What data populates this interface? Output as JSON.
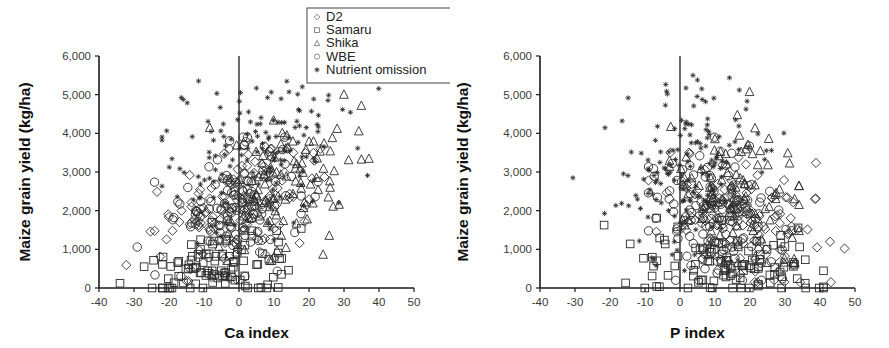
{
  "figure": {
    "panels": [
      "ca",
      "p"
    ]
  },
  "legend": {
    "name": "series-legend",
    "entries": [
      {
        "label": "D2",
        "marker": "diamond",
        "marker_icon": "diamond-marker-icon"
      },
      {
        "label": "Samaru",
        "marker": "square",
        "marker_icon": "square-marker-icon"
      },
      {
        "label": "Shika",
        "marker": "triangle",
        "marker_icon": "triangle-marker-icon"
      },
      {
        "label": "WBE",
        "marker": "circle",
        "marker_icon": "circle-marker-icon"
      },
      {
        "label": "Nutrient omission",
        "marker": "star",
        "marker_icon": "star-marker-icon"
      }
    ]
  },
  "chart_data": [
    {
      "id": "ca",
      "type": "scatter",
      "title": "",
      "xlabel": "Ca index",
      "ylabel": "Maize grain yield (kg/ha)",
      "xlim": [
        -40,
        50
      ],
      "ylim": [
        0,
        6000
      ],
      "xticks": [
        -40,
        -30,
        -20,
        -10,
        0,
        10,
        20,
        30,
        40,
        50
      ],
      "xticklabels": [
        "-40",
        "-30",
        "-20",
        "-10",
        "0",
        "10",
        "20",
        "30",
        "40",
        "50"
      ],
      "yticks": [
        0,
        1000,
        2000,
        3000,
        4000,
        5000,
        6000
      ],
      "yticklabels": [
        "0",
        "1,000",
        "2,000",
        "3,000",
        "4,000",
        "5,000",
        "6,000"
      ],
      "grid": false,
      "zero_reference_line": 0,
      "legend_position": "top-right-outside",
      "series": [
        {
          "name": "D2",
          "marker": "diamond",
          "n": 118,
          "x_center": -2.0,
          "x_spread": 11.5,
          "x_min": -36,
          "x_max": 34,
          "y_center": 1950,
          "y_spread": 780,
          "y_min": 180,
          "y_max": 3600,
          "slope": 38,
          "seed": 1201
        },
        {
          "name": "Samaru",
          "marker": "square",
          "n": 95,
          "x_center": -4.0,
          "x_spread": 11.0,
          "x_min": -34,
          "x_max": 21,
          "y_center": 620,
          "y_spread": 470,
          "y_min": 0,
          "y_max": 1700,
          "slope": 12,
          "seed": 2309
        },
        {
          "name": "Shika",
          "marker": "triangle",
          "n": 102,
          "x_center": 14.0,
          "x_spread": 10.5,
          "x_min": -12,
          "x_max": 40,
          "y_center": 2700,
          "y_spread": 900,
          "y_min": 700,
          "y_max": 5000,
          "slope": 30,
          "seed": 3407
        },
        {
          "name": "WBE",
          "marker": "circle",
          "n": 126,
          "x_center": -1.0,
          "x_spread": 10.0,
          "x_min": -30,
          "x_max": 30,
          "y_center": 2150,
          "y_spread": 800,
          "y_min": 300,
          "y_max": 3900,
          "slope": 34,
          "seed": 4513
        },
        {
          "name": "Nutrient omission",
          "marker": "star",
          "n": 150,
          "x_center": 4.0,
          "x_spread": 13.5,
          "x_min": -22,
          "x_max": 40,
          "y_center": 3500,
          "y_spread": 1050,
          "y_min": 900,
          "y_max": 5600,
          "slope": 18,
          "seed": 5619
        }
      ]
    },
    {
      "id": "p",
      "type": "scatter",
      "title": "",
      "xlabel": "P index",
      "ylabel": "Maize grain yield (kg/ha)",
      "xlim": [
        -40,
        50
      ],
      "ylim": [
        0,
        6000
      ],
      "xticks": [
        -40,
        -30,
        -20,
        -10,
        0,
        10,
        20,
        30,
        40,
        50
      ],
      "xticklabels": [
        "-40",
        "-30",
        "-20",
        "-10",
        "0",
        "10",
        "20",
        "30",
        "40",
        "50"
      ],
      "yticks": [
        0,
        1000,
        2000,
        3000,
        4000,
        5000,
        6000
      ],
      "yticklabels": [
        "0",
        "1,000",
        "2,000",
        "3,000",
        "4,000",
        "5,000",
        "6,000"
      ],
      "grid": false,
      "zero_reference_line": 0,
      "legend_position": "shared-with-left-panel",
      "series": [
        {
          "name": "D2",
          "marker": "diamond",
          "n": 118,
          "x_center": 17.0,
          "x_spread": 11.5,
          "x_min": -9,
          "x_max": 47,
          "y_center": 1750,
          "y_spread": 760,
          "y_min": 150,
          "y_max": 3500,
          "slope": -22,
          "seed": 6101
        },
        {
          "name": "Samaru",
          "marker": "square",
          "n": 100,
          "x_center": 12.0,
          "x_spread": 15.0,
          "x_min": -40,
          "x_max": 41,
          "y_center": 580,
          "y_spread": 450,
          "y_min": 0,
          "y_max": 2100,
          "slope": -6,
          "seed": 7213
        },
        {
          "name": "Shika",
          "marker": "triangle",
          "n": 102,
          "x_center": 16.0,
          "x_spread": 9.5,
          "x_min": -3,
          "x_max": 34,
          "y_center": 2350,
          "y_spread": 920,
          "y_min": 650,
          "y_max": 5800,
          "slope": -14,
          "seed": 8317
        },
        {
          "name": "WBE",
          "marker": "circle",
          "n": 126,
          "x_center": 10.0,
          "x_spread": 9.0,
          "x_min": -9,
          "x_max": 32,
          "y_center": 1900,
          "y_spread": 820,
          "y_min": 200,
          "y_max": 3900,
          "slope": -18,
          "seed": 9421
        },
        {
          "name": "Nutrient omission",
          "marker": "star",
          "n": 155,
          "x_center": 3.0,
          "x_spread": 10.5,
          "x_min": -38,
          "x_max": 32,
          "y_center": 3150,
          "y_spread": 1050,
          "y_min": 450,
          "y_max": 5500,
          "slope": 22,
          "seed": 1523
        }
      ]
    }
  ]
}
